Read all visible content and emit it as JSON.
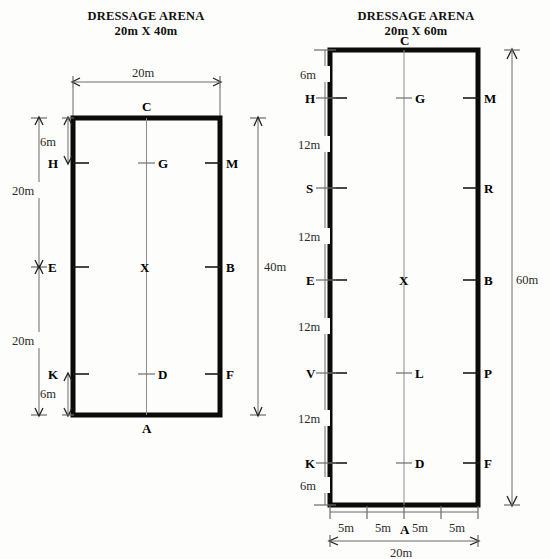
{
  "page": {
    "background_color": "#fdfdfb",
    "line_color": "#0b0b0b",
    "dimension_color": "#6b6b6b",
    "center_line_color": "#8d8d8d"
  },
  "arenas": [
    {
      "id": "arena-20x40",
      "title_line1": "DRESSAGE ARENA",
      "title_line2": "20m X 40m",
      "width_label": "20m",
      "length_label": "40m",
      "top_marker": "C",
      "bottom_marker": "A",
      "center_marker": "X",
      "left_segments": [
        "6m",
        "20m",
        "20m",
        "6m"
      ],
      "rows": [
        {
          "left": "H",
          "center": "G",
          "right": "M"
        },
        {
          "left": "E",
          "center": "X",
          "right": "B"
        },
        {
          "left": "K",
          "center": "D",
          "right": "F"
        }
      ],
      "left_markers": [
        "H",
        "E",
        "K"
      ],
      "center_markers": [
        "G",
        "X",
        "D"
      ],
      "right_markers": [
        "M",
        "B",
        "F"
      ]
    },
    {
      "id": "arena-20x60",
      "title_line1": "DRESSAGE ARENA",
      "title_line2": "20m X 60m",
      "width_label": "20m",
      "length_label": "60m",
      "top_marker": "C",
      "bottom_marker": "A",
      "center_marker": "X",
      "left_segments": [
        "6m",
        "12m",
        "12m",
        "12m",
        "12m",
        "6m"
      ],
      "bottom_segments": [
        "5m",
        "5m",
        "5m",
        "5m"
      ],
      "rows": [
        {
          "left": "H",
          "center": "G",
          "right": "M"
        },
        {
          "left": "S",
          "center": "",
          "right": "R"
        },
        {
          "left": "E",
          "center": "X",
          "right": "B"
        },
        {
          "left": "V",
          "center": "L",
          "right": "P"
        },
        {
          "left": "K",
          "center": "D",
          "right": "F"
        }
      ],
      "left_markers": [
        "H",
        "S",
        "E",
        "V",
        "K"
      ],
      "center_markers": [
        "G",
        "X",
        "L",
        "D"
      ],
      "right_markers": [
        "M",
        "R",
        "B",
        "P",
        "F"
      ]
    }
  ]
}
